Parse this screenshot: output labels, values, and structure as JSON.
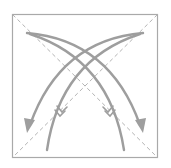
{
  "diagram": {
    "type": "origami-fold-diagram",
    "colors": {
      "frame": "#a9a9a9",
      "dashed_lines": "#b4b4b4",
      "arrows": "#9e9e9e",
      "background": "#ffffff"
    },
    "elements": {
      "square_frame": "outline of paper square",
      "diagonals": [
        "top-left to bottom-right dashed",
        "top-right to bottom-left dashed"
      ],
      "arrows": [
        {
          "name": "fold-arrow-tl-to-br",
          "direction": "from top-left corner curving down to bottom-right, arrowhead"
        },
        {
          "name": "return-arrow-br-to-tl",
          "direction": "from bottom-right curving up to top-left, feathered tail"
        },
        {
          "name": "fold-arrow-tr-to-bl",
          "direction": "from top-right corner curving down to bottom-left, arrowhead"
        },
        {
          "name": "return-arrow-bl-to-tr",
          "direction": "from bottom-left curving up to top-right, feathered tail"
        }
      ]
    }
  }
}
